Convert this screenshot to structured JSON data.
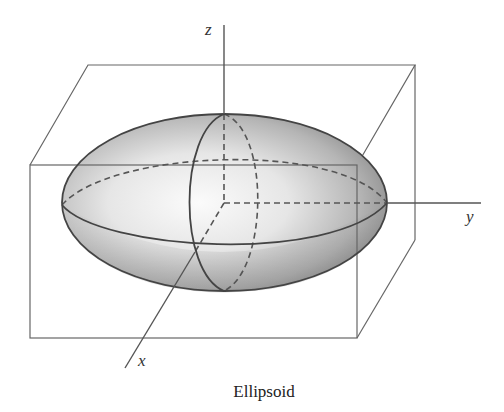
{
  "figure": {
    "caption": "Ellipsoid",
    "axes": {
      "x_label": "x",
      "y_label": "y",
      "z_label": "z"
    },
    "colors": {
      "line": "#555555",
      "outline": "#444444",
      "shade_light": "#f4f4f4",
      "shade_dark": "#8a8a8a"
    }
  }
}
